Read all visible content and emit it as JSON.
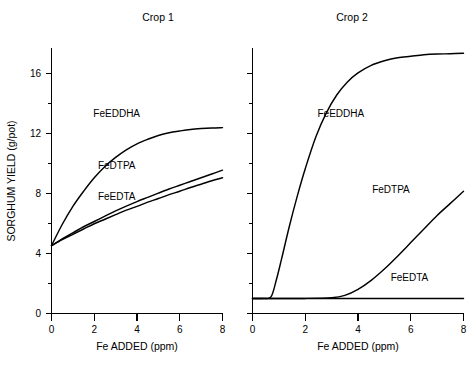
{
  "chart_data": {
    "type": "line",
    "title": "",
    "xlabel": "Fe ADDED (ppm)",
    "ylabel": "SORGHUM YIELD (g/pot)",
    "xlim": [
      0,
      8
    ],
    "ylim": [
      0,
      17.6
    ],
    "x_ticks": [
      0,
      2,
      4,
      6,
      8
    ],
    "x_tick_labels": [
      "0",
      "2",
      "4",
      "6",
      "8"
    ],
    "x_minor_ticks": [
      1,
      3,
      5,
      7
    ],
    "y_ticks": [
      0,
      4,
      8,
      12,
      16
    ],
    "y_tick_labels": [
      "0",
      "4",
      "8",
      "12",
      "16"
    ],
    "y_minor_ticks": [
      2,
      6,
      10,
      14
    ],
    "grid": false,
    "legend": "inline-labels",
    "panels": [
      {
        "name": "Crop 1",
        "title": "Crop 1",
        "y_axis_labeled": true,
        "series": [
          {
            "name": "FeEDDHA",
            "label": "FeEDDHA",
            "label_x": 3.05,
            "label_y": 13.0,
            "x": [
              0,
              0.5,
              1,
              1.5,
              2,
              2.5,
              3,
              3.5,
              4,
              4.5,
              5,
              5.5,
              6,
              6.5,
              7,
              7.5,
              8
            ],
            "y": [
              4.5,
              5.9,
              7.1,
              8.1,
              9.0,
              9.75,
              10.35,
              10.85,
              11.25,
              11.55,
              11.8,
              11.98,
              12.1,
              12.2,
              12.26,
              12.3,
              12.32
            ]
          },
          {
            "name": "FeDTPA",
            "label": "FeDTPA",
            "label_x": 3.05,
            "label_y": 9.55,
            "x": [
              0,
              0.5,
              1,
              1.5,
              2,
              2.5,
              3,
              3.5,
              4,
              4.5,
              5,
              5.5,
              6,
              6.5,
              7,
              7.5,
              8
            ],
            "y": [
              4.5,
              4.95,
              5.35,
              5.75,
              6.1,
              6.45,
              6.8,
              7.12,
              7.42,
              7.7,
              7.98,
              8.25,
              8.5,
              8.75,
              9.0,
              9.25,
              9.5
            ]
          },
          {
            "name": "FeEDTA",
            "label": "FeEDTA",
            "label_x": 3.05,
            "label_y": 7.55,
            "x": [
              0,
              0.5,
              1,
              1.5,
              2,
              2.5,
              3,
              3.5,
              4,
              4.5,
              5,
              5.5,
              6,
              6.5,
              7,
              7.5,
              8
            ],
            "y": [
              4.5,
              4.9,
              5.25,
              5.6,
              5.95,
              6.25,
              6.55,
              6.85,
              7.1,
              7.38,
              7.62,
              7.88,
              8.1,
              8.35,
              8.57,
              8.8,
              9.0
            ]
          }
        ]
      },
      {
        "name": "Crop 2",
        "title": "Crop 2",
        "y_axis_labeled": false,
        "series": [
          {
            "name": "FeEDDHA",
            "label": "FeEDDHA",
            "label_x": 3.35,
            "label_y": 13.0,
            "x": [
              0,
              0.4,
              0.7,
              0.9,
              1.1,
              1.4,
              1.7,
              2.0,
              2.4,
              2.8,
              3.2,
              3.6,
              4.0,
              4.5,
              5.0,
              5.5,
              6.0,
              6.5,
              7.0,
              7.5,
              8
            ],
            "y": [
              1.0,
              1.0,
              1.1,
              2.2,
              3.6,
              5.8,
              7.8,
              9.6,
              11.7,
              13.3,
              14.5,
              15.35,
              15.95,
              16.45,
              16.75,
              16.95,
              17.05,
              17.15,
              17.2,
              17.22,
              17.25
            ]
          },
          {
            "name": "FeDTPA",
            "label": "FeDTPA",
            "label_x": 5.25,
            "label_y": 8.0,
            "x": [
              0,
              1,
              2,
              3,
              3.5,
              4,
              4.5,
              5,
              5.5,
              6,
              6.5,
              7,
              7.5,
              8
            ],
            "y": [
              1.0,
              1.0,
              1.0,
              1.05,
              1.2,
              1.6,
              2.2,
              2.95,
              3.8,
              4.7,
              5.6,
              6.5,
              7.3,
              8.1
            ]
          },
          {
            "name": "FeEDTA",
            "label": "FeEDTA",
            "label_x": 5.95,
            "label_y": 2.15,
            "x": [
              0,
              2,
              4,
              6,
              8
            ],
            "y": [
              1.0,
              1.0,
              1.0,
              1.0,
              1.0
            ]
          }
        ]
      }
    ]
  }
}
